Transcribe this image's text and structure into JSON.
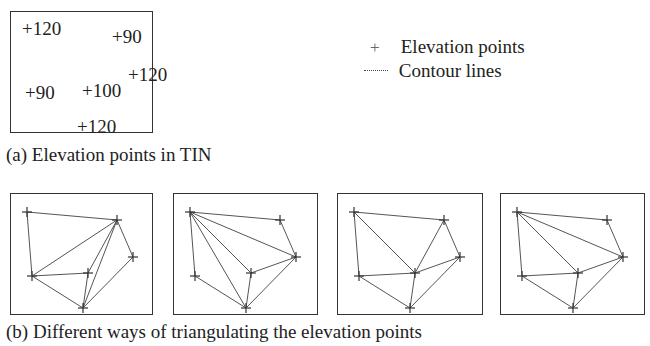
{
  "panel_a": {
    "box": {
      "x": 10,
      "y": 11,
      "w": 143,
      "h": 122
    },
    "labels": [
      {
        "text": "+120",
        "x": 22,
        "y": 19
      },
      {
        "text": "+90",
        "x": 112,
        "y": 27
      },
      {
        "text": "+120",
        "x": 128,
        "y": 65
      },
      {
        "text": "+90",
        "x": 25,
        "y": 83
      },
      {
        "text": "+100",
        "x": 82,
        "y": 81
      },
      {
        "text": "+120",
        "x": 77,
        "y": 117
      }
    ],
    "caption": "(a) Elevation points in TIN"
  },
  "legend": {
    "items": [
      {
        "symbol": "+",
        "label": "Elevation points",
        "icon": "plus-marker-icon"
      },
      {
        "symbol": "dotted-line",
        "label": "Contour lines",
        "icon": "dotted-line-icon"
      }
    ]
  },
  "panel_b": {
    "caption": "(b) Different ways of triangulating the elevation points",
    "points": {
      "A": [
        17,
        19
      ],
      "B": [
        107,
        27
      ],
      "C": [
        123,
        64
      ],
      "D": [
        78,
        80
      ],
      "E": [
        22,
        83
      ],
      "F": [
        73,
        115
      ]
    },
    "panels": [
      {
        "x": 10,
        "y": 193,
        "w": 143,
        "h": 122,
        "edges": [
          [
            "A",
            "B"
          ],
          [
            "A",
            "E"
          ],
          [
            "E",
            "B"
          ],
          [
            "E",
            "D"
          ],
          [
            "E",
            "F"
          ],
          [
            "B",
            "C"
          ],
          [
            "B",
            "D"
          ],
          [
            "B",
            "F"
          ],
          [
            "C",
            "F"
          ],
          [
            "D",
            "F"
          ]
        ]
      },
      {
        "x": 173,
        "y": 193,
        "w": 145,
        "h": 122,
        "edges": [
          [
            "A",
            "B"
          ],
          [
            "A",
            "E"
          ],
          [
            "A",
            "D"
          ],
          [
            "A",
            "C"
          ],
          [
            "A",
            "F"
          ],
          [
            "B",
            "C"
          ],
          [
            "C",
            "D"
          ],
          [
            "C",
            "F"
          ],
          [
            "D",
            "F"
          ],
          [
            "E",
            "F"
          ]
        ]
      },
      {
        "x": 337,
        "y": 193,
        "w": 146,
        "h": 122,
        "edges": [
          [
            "A",
            "B"
          ],
          [
            "A",
            "E"
          ],
          [
            "A",
            "D"
          ],
          [
            "B",
            "D"
          ],
          [
            "B",
            "C"
          ],
          [
            "C",
            "D"
          ],
          [
            "E",
            "D"
          ],
          [
            "C",
            "F"
          ],
          [
            "D",
            "F"
          ],
          [
            "E",
            "F"
          ]
        ]
      },
      {
        "x": 500,
        "y": 193,
        "w": 145,
        "h": 122,
        "edges": [
          [
            "A",
            "B"
          ],
          [
            "A",
            "E"
          ],
          [
            "A",
            "D"
          ],
          [
            "A",
            "C"
          ],
          [
            "B",
            "C"
          ],
          [
            "C",
            "D"
          ],
          [
            "E",
            "D"
          ],
          [
            "C",
            "F"
          ],
          [
            "D",
            "F"
          ],
          [
            "E",
            "F"
          ]
        ]
      }
    ]
  },
  "colors": {
    "line": "#555555",
    "border": "#333333",
    "text": "#222222"
  }
}
